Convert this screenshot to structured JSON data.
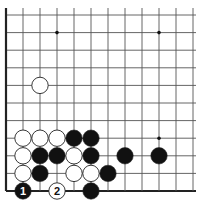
{
  "diagram": {
    "type": "go-board-partial",
    "view": "bottom-left corner",
    "colors": {
      "line": "#555555",
      "edge": "#222222",
      "black": "#111111",
      "white": "#ffffff",
      "stone_outline": "#222222"
    },
    "grid": {
      "x0": 6,
      "dx": 17,
      "cols": 12,
      "y0": 15,
      "dy": 17.6,
      "rows": 11
    },
    "star_points": [
      {
        "c": 3,
        "r": 1
      },
      {
        "c": 9,
        "r": 1
      },
      {
        "c": 9,
        "r": 7
      }
    ],
    "stones": [
      {
        "c": 2,
        "r": 4,
        "color": "white",
        "label": ""
      },
      {
        "c": 1,
        "r": 7,
        "color": "white",
        "label": ""
      },
      {
        "c": 2,
        "r": 7,
        "color": "white",
        "label": ""
      },
      {
        "c": 3,
        "r": 7,
        "color": "white",
        "label": ""
      },
      {
        "c": 4,
        "r": 7,
        "color": "black",
        "label": ""
      },
      {
        "c": 5,
        "r": 7,
        "color": "black",
        "label": ""
      },
      {
        "c": 1,
        "r": 8,
        "color": "white",
        "label": ""
      },
      {
        "c": 2,
        "r": 8,
        "color": "black",
        "label": ""
      },
      {
        "c": 3,
        "r": 8,
        "color": "black",
        "label": ""
      },
      {
        "c": 4,
        "r": 8,
        "color": "white",
        "label": ""
      },
      {
        "c": 5,
        "r": 8,
        "color": "black",
        "label": ""
      },
      {
        "c": 7,
        "r": 8,
        "color": "black",
        "label": ""
      },
      {
        "c": 9,
        "r": 8,
        "color": "black",
        "label": ""
      },
      {
        "c": 1,
        "r": 9,
        "color": "white",
        "label": ""
      },
      {
        "c": 2,
        "r": 9,
        "color": "black",
        "label": ""
      },
      {
        "c": 4,
        "r": 9,
        "color": "white",
        "label": ""
      },
      {
        "c": 5,
        "r": 9,
        "color": "white",
        "label": ""
      },
      {
        "c": 6,
        "r": 9,
        "color": "black",
        "label": ""
      },
      {
        "c": 1,
        "r": 10,
        "color": "black",
        "label": "1"
      },
      {
        "c": 3,
        "r": 10,
        "color": "white",
        "label": "2"
      },
      {
        "c": 5,
        "r": 10,
        "color": "black",
        "label": ""
      }
    ]
  }
}
